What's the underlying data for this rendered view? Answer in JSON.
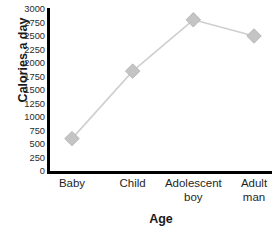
{
  "chart_data": {
    "type": "line",
    "title": "",
    "xlabel": "Age",
    "ylabel": "Calories a day",
    "categories": [
      "Baby",
      "Child",
      "Adolescent boy",
      "Adult man"
    ],
    "category_lines": [
      [
        "Baby"
      ],
      [
        "Child"
      ],
      [
        "Adolescent",
        "boy"
      ],
      [
        "Adult",
        "man"
      ]
    ],
    "values": [
      600,
      1850,
      2800,
      2500
    ],
    "series": [
      {
        "name": "Calories a day",
        "values": [
          600,
          1850,
          2800,
          2500
        ]
      }
    ],
    "ylim": [
      0,
      3000
    ],
    "ytick_step": 250,
    "yticks": [
      "3000",
      "2750",
      "2500",
      "2250",
      "2000",
      "1750",
      "1500",
      "1250",
      "1000",
      "750",
      "500",
      "250",
      "0"
    ],
    "ytick_values": [
      3000,
      2750,
      2500,
      2250,
      2000,
      1750,
      1500,
      1250,
      1000,
      750,
      500,
      250,
      0
    ],
    "grid": false,
    "legend": false,
    "legend_position": "none",
    "marker": "diamond",
    "colors": {
      "line": "#cfcfcf",
      "marker_fill": "#c4c4c4",
      "marker_stroke": "#b8b8b8",
      "axis": "#000000",
      "text": "#1a1a1a",
      "background": "#ffffff"
    }
  }
}
